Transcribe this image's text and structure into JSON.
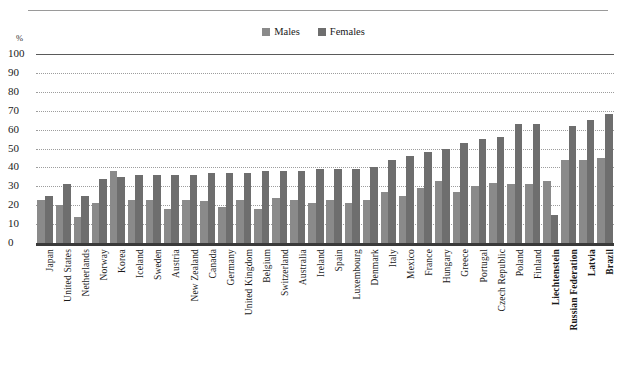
{
  "chart_data": {
    "type": "bar",
    "title": "",
    "xlabel": "",
    "ylabel": "%",
    "ylim": [
      0,
      100
    ],
    "ytick_step": 10,
    "yticks": [
      100,
      90,
      80,
      70,
      60,
      50,
      40,
      30,
      20,
      10,
      0
    ],
    "grid": true,
    "legend_position": "top-center",
    "sorted_by": "Females ascending",
    "categories": [
      "Japan",
      "United States",
      "Netherlands",
      "Norway",
      "Korea",
      "Iceland",
      "Sweden",
      "Austria",
      "New Zealand",
      "Canada",
      "Germany",
      "United Kingdom",
      "Belgium",
      "Switzerland",
      "Australia",
      "Ireland",
      "Spain",
      "Luxembourg",
      "Denmark",
      "Italy",
      "Mexico",
      "France",
      "Hungary",
      "Greece",
      "Portugal",
      "Czech Republic",
      "Poland",
      "Finland",
      "Liechtenstein",
      "Russian Federation",
      "Latvia",
      "Brazil"
    ],
    "bold_categories": [
      "Liechtenstein",
      "Russian Federation",
      "Latvia",
      "Brazil"
    ],
    "series": [
      {
        "name": "Males",
        "color": "#8a8a8a",
        "values": [
          23,
          20,
          14,
          21,
          38,
          23,
          23,
          18,
          23,
          22,
          19,
          23,
          18,
          24,
          23,
          21,
          23,
          21,
          23,
          27,
          25,
          29,
          33,
          27,
          30,
          32,
          31,
          31,
          33,
          44,
          44,
          45
        ]
      },
      {
        "name": "Females",
        "color": "#6e6e6e",
        "values": [
          25,
          31,
          25,
          34,
          35,
          36,
          36,
          36,
          36,
          37,
          37,
          37,
          38,
          38,
          38,
          39,
          39,
          39,
          40,
          44,
          46,
          48,
          50,
          53,
          55,
          56,
          63,
          63,
          15,
          62,
          65,
          68
        ]
      }
    ]
  },
  "legend": {
    "items": [
      {
        "label": "Males",
        "color": "#8a8a8a"
      },
      {
        "label": "Females",
        "color": "#6e6e6e"
      }
    ]
  },
  "axis": {
    "unit_label": "%"
  },
  "colors": {
    "males": "#8a8a8a",
    "females": "#6e6e6e",
    "gridline": "#9d9d9d",
    "axis": "#3a3a3a"
  }
}
